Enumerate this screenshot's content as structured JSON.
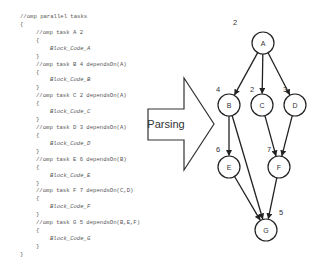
{
  "code": {
    "lines": [
      {
        "text": "//omp parallel tasks",
        "indent": 0,
        "kind": "directive"
      },
      {
        "text": "{",
        "indent": 0,
        "kind": "brace"
      },
      {
        "text": "//omp task A 2",
        "indent": 1,
        "kind": "directive"
      },
      {
        "text": "{",
        "indent": 1,
        "kind": "brace"
      },
      {
        "text": "Block_Code_A",
        "indent": 2,
        "kind": "block"
      },
      {
        "text": "}",
        "indent": 1,
        "kind": "brace"
      },
      {
        "text": "//omp task B 4 dependsOn(A)",
        "indent": 1,
        "kind": "directive"
      },
      {
        "text": "{",
        "indent": 1,
        "kind": "brace"
      },
      {
        "text": "Block_Code_B",
        "indent": 2,
        "kind": "block"
      },
      {
        "text": "}",
        "indent": 1,
        "kind": "brace"
      },
      {
        "text": "//omp task C 2 dependsOn(A)",
        "indent": 1,
        "kind": "directive"
      },
      {
        "text": "{",
        "indent": 1,
        "kind": "brace"
      },
      {
        "text": "Block_Code_C",
        "indent": 2,
        "kind": "block"
      },
      {
        "text": "}",
        "indent": 1,
        "kind": "brace"
      },
      {
        "text": "//omp task D 3 dependsOn(A)",
        "indent": 1,
        "kind": "directive"
      },
      {
        "text": "{",
        "indent": 1,
        "kind": "brace"
      },
      {
        "text": "Block_Code_D",
        "indent": 2,
        "kind": "block"
      },
      {
        "text": "}",
        "indent": 1,
        "kind": "brace"
      },
      {
        "text": "//omp task E 6 dependsOn(B)",
        "indent": 1,
        "kind": "directive"
      },
      {
        "text": "{",
        "indent": 1,
        "kind": "brace"
      },
      {
        "text": "Block_Code_E",
        "indent": 2,
        "kind": "block"
      },
      {
        "text": "}",
        "indent": 1,
        "kind": "brace"
      },
      {
        "text": "//omp task F 7 dependsOn(C,D)",
        "indent": 1,
        "kind": "directive"
      },
      {
        "text": "{",
        "indent": 1,
        "kind": "brace"
      },
      {
        "text": "Block_Code_F",
        "indent": 2,
        "kind": "block"
      },
      {
        "text": "}",
        "indent": 1,
        "kind": "brace"
      },
      {
        "text": "//omp task G 5 dependsOn(B,E,F)",
        "indent": 1,
        "kind": "directive"
      },
      {
        "text": "{",
        "indent": 1,
        "kind": "brace"
      },
      {
        "text": "Block_Code_G",
        "indent": 2,
        "kind": "block"
      },
      {
        "text": "}",
        "indent": 1,
        "kind": "brace"
      },
      {
        "text": "}",
        "indent": 0,
        "kind": "brace"
      }
    ]
  },
  "arrow": {
    "label": "Parsing"
  },
  "graph": {
    "nodes": [
      {
        "id": "A",
        "label": "A",
        "weight": "2",
        "cx": 263,
        "cy": 43,
        "wx": 233,
        "wy": 25
      },
      {
        "id": "B",
        "label": "B",
        "weight": "4",
        "cx": 229,
        "cy": 105,
        "wx": 216,
        "wy": 92
      },
      {
        "id": "C",
        "label": "C",
        "weight": "2",
        "cx": 262,
        "cy": 105,
        "wx": 250,
        "wy": 92
      },
      {
        "id": "D",
        "label": "D",
        "weight": "3",
        "cx": 295,
        "cy": 105,
        "wx": 283,
        "wy": 92
      },
      {
        "id": "E",
        "label": "E",
        "weight": "6",
        "cx": 229,
        "cy": 167,
        "wx": 216,
        "wy": 152
      },
      {
        "id": "F",
        "label": "F",
        "weight": "7",
        "cx": 279,
        "cy": 167,
        "wx": 267,
        "wy": 152
      },
      {
        "id": "G",
        "label": "G",
        "weight": "5",
        "cx": 266,
        "cy": 230,
        "wx": 279,
        "wy": 215
      }
    ],
    "edges": [
      {
        "from": "A",
        "to": "B"
      },
      {
        "from": "A",
        "to": "C"
      },
      {
        "from": "A",
        "to": "D"
      },
      {
        "from": "B",
        "to": "E"
      },
      {
        "from": "B",
        "to": "G"
      },
      {
        "from": "C",
        "to": "F"
      },
      {
        "from": "D",
        "to": "F"
      },
      {
        "from": "E",
        "to": "G"
      },
      {
        "from": "F",
        "to": "G"
      }
    ]
  }
}
